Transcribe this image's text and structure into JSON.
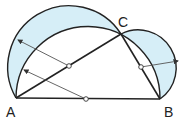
{
  "diagram": {
    "type": "geometric-figure",
    "points": {
      "A": {
        "label": "A",
        "x": 16,
        "y": 98
      },
      "B": {
        "label": "B",
        "x": 160,
        "y": 99
      },
      "C": {
        "label": "C",
        "x": 121,
        "y": 34
      }
    },
    "labels": {
      "A": "A",
      "B": "B",
      "C": "C"
    },
    "colors": {
      "fill": "#d6eef7",
      "stroke": "#222222",
      "arrow": "#555555"
    }
  }
}
